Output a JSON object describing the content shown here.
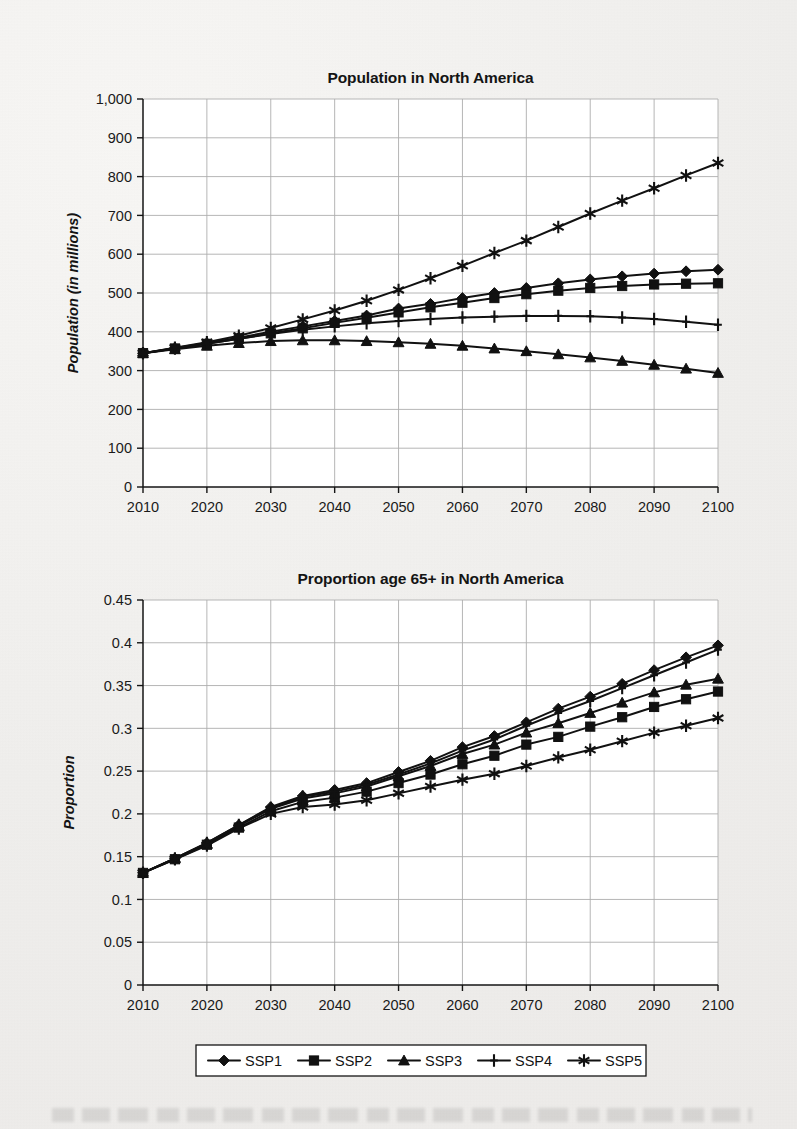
{
  "page": {
    "background_color": "#efeeec",
    "ink_color": "#141414",
    "grid_color": "#aeaeae"
  },
  "legend": {
    "name": "scenario-legend",
    "position": "bottom-center",
    "items": [
      {
        "label": "SSP1",
        "marker": "diamond"
      },
      {
        "label": "SSP2",
        "marker": "square"
      },
      {
        "label": "SSP3",
        "marker": "triangle"
      },
      {
        "label": "SSP4",
        "marker": "plus"
      },
      {
        "label": "SSP5",
        "marker": "asterisk"
      }
    ]
  },
  "chart_data": [
    {
      "id": "population-chart",
      "type": "line",
      "title": "Population in North America",
      "xlabel": "",
      "ylabel": "Population (in millions)",
      "xlim": [
        2010,
        2100
      ],
      "ylim": [
        0,
        1000
      ],
      "xticks": [
        2010,
        2020,
        2030,
        2040,
        2050,
        2060,
        2070,
        2080,
        2090,
        2100
      ],
      "yticks": [
        0,
        100,
        200,
        300,
        400,
        500,
        600,
        700,
        800,
        900,
        1000
      ],
      "ytick_labels": [
        "0",
        "100",
        "200",
        "300",
        "400",
        "500",
        "600",
        "700",
        "800",
        "900",
        "1,000"
      ],
      "xtick_labels": [
        "2010",
        "2020",
        "2030",
        "2040",
        "2050",
        "2060",
        "2070",
        "2080",
        "2090",
        "2100"
      ],
      "grid": true,
      "legend_position": "shared-bottom",
      "x": [
        2010,
        2015,
        2020,
        2025,
        2030,
        2035,
        2040,
        2045,
        2050,
        2055,
        2060,
        2065,
        2070,
        2075,
        2080,
        2085,
        2090,
        2095,
        2100
      ],
      "series": [
        {
          "name": "SSP1",
          "marker": "diamond",
          "values": [
            345,
            358,
            371,
            385,
            400,
            414,
            428,
            442,
            460,
            472,
            487,
            500,
            513,
            525,
            535,
            543,
            550,
            556,
            560
          ]
        },
        {
          "name": "SSP2",
          "marker": "square",
          "values": [
            345,
            357,
            369,
            382,
            396,
            409,
            423,
            436,
            450,
            463,
            475,
            487,
            497,
            506,
            513,
            518,
            522,
            524,
            525
          ]
        },
        {
          "name": "SSP3",
          "marker": "triangle",
          "values": [
            345,
            355,
            364,
            371,
            376,
            378,
            378,
            376,
            373,
            369,
            364,
            357,
            350,
            342,
            334,
            325,
            315,
            305,
            294
          ]
        },
        {
          "name": "SSP4",
          "marker": "plus",
          "values": [
            345,
            357,
            369,
            382,
            394,
            405,
            414,
            422,
            428,
            433,
            437,
            439,
            441,
            441,
            440,
            437,
            433,
            426,
            418
          ]
        },
        {
          "name": "SSP5",
          "marker": "asterisk",
          "values": [
            345,
            359,
            373,
            390,
            410,
            432,
            455,
            480,
            508,
            538,
            570,
            603,
            635,
            670,
            705,
            738,
            770,
            803,
            835
          ]
        }
      ]
    },
    {
      "id": "proportion-65-plus-chart",
      "type": "line",
      "title": "Proportion age 65+ in North America",
      "xlabel": "",
      "ylabel": "Proportion",
      "xlim": [
        2010,
        2100
      ],
      "ylim": [
        0,
        0.45
      ],
      "xticks": [
        2010,
        2020,
        2030,
        2040,
        2050,
        2060,
        2070,
        2080,
        2090,
        2100
      ],
      "yticks": [
        0,
        0.05,
        0.1,
        0.15,
        0.2,
        0.25,
        0.3,
        0.35,
        0.4,
        0.45
      ],
      "ytick_labels": [
        "0",
        "0.05",
        "0.1",
        "0.15",
        "0.2",
        "0.25",
        "0.3",
        "0.35",
        "0.4",
        "0.45"
      ],
      "xtick_labels": [
        "2010",
        "2020",
        "2030",
        "2040",
        "2050",
        "2060",
        "2070",
        "2080",
        "2090",
        "2100"
      ],
      "grid": true,
      "legend_position": "shared-bottom",
      "x": [
        2010,
        2015,
        2020,
        2025,
        2030,
        2035,
        2040,
        2045,
        2050,
        2055,
        2060,
        2065,
        2070,
        2075,
        2080,
        2085,
        2090,
        2095,
        2100
      ],
      "series": [
        {
          "name": "SSP1",
          "marker": "diamond",
          "values": [
            0.131,
            0.148,
            0.166,
            0.187,
            0.208,
            0.221,
            0.228,
            0.236,
            0.249,
            0.262,
            0.278,
            0.291,
            0.307,
            0.323,
            0.337,
            0.352,
            0.368,
            0.383,
            0.397
          ]
        },
        {
          "name": "SSP2",
          "marker": "square",
          "values": [
            0.131,
            0.147,
            0.164,
            0.184,
            0.203,
            0.214,
            0.219,
            0.226,
            0.236,
            0.246,
            0.258,
            0.268,
            0.281,
            0.29,
            0.302,
            0.313,
            0.325,
            0.334,
            0.343
          ]
        },
        {
          "name": "SSP3",
          "marker": "triangle",
          "values": [
            0.131,
            0.148,
            0.165,
            0.186,
            0.206,
            0.218,
            0.224,
            0.232,
            0.244,
            0.256,
            0.27,
            0.281,
            0.295,
            0.306,
            0.318,
            0.33,
            0.342,
            0.351,
            0.358
          ]
        },
        {
          "name": "SSP4",
          "marker": "plus",
          "values": [
            0.131,
            0.148,
            0.166,
            0.187,
            0.207,
            0.22,
            0.226,
            0.234,
            0.246,
            0.259,
            0.274,
            0.287,
            0.303,
            0.318,
            0.332,
            0.347,
            0.362,
            0.377,
            0.392
          ]
        },
        {
          "name": "SSP5",
          "marker": "asterisk",
          "values": [
            0.131,
            0.147,
            0.163,
            0.183,
            0.2,
            0.208,
            0.211,
            0.216,
            0.224,
            0.232,
            0.24,
            0.247,
            0.256,
            0.266,
            0.275,
            0.285,
            0.295,
            0.303,
            0.312
          ]
        }
      ]
    }
  ]
}
